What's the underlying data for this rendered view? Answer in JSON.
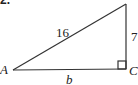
{
  "problem": {
    "number": "2."
  },
  "triangle": {
    "vertices": {
      "A": "A",
      "C": "C"
    },
    "sides": {
      "hypotenuse": "16",
      "vertical_leg": "7",
      "base": "b"
    },
    "right_angle_at": "C"
  },
  "colors": {
    "stroke": "#333333",
    "text": "#222222",
    "background": "#ffffff"
  }
}
